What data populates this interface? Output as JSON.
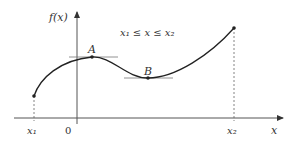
{
  "diagram": {
    "y_axis_label": "f(x)",
    "x_axis_label": "x",
    "domain_label": "x₁ ≤ x ≤ x₂",
    "point_a_label": "A",
    "point_b_label": "B",
    "tick_x1": "x₁",
    "tick_zero": "0",
    "tick_x2": "x₂",
    "colors": {
      "curve": "#222222",
      "axis": "#555555",
      "tangent": "#777777"
    }
  }
}
